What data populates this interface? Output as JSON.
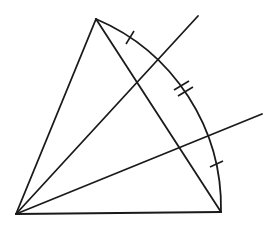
{
  "diagram": {
    "stroke_color": "#1a1a1a",
    "background": "#ffffff",
    "points": {
      "O": [
        16,
        214
      ],
      "A": [
        96,
        19
      ],
      "B": [
        221,
        212
      ]
    },
    "rays": [
      {
        "from": [
          16,
          214
        ],
        "to": [
          198,
          16
        ]
      },
      {
        "from": [
          16,
          214
        ],
        "to": [
          262,
          114
        ]
      }
    ],
    "arc": {
      "center": [
        16,
        214
      ],
      "radius": 205,
      "from": "A",
      "to": "B"
    },
    "tick_marks": [
      {
        "count": 1,
        "at": [
          130,
          38
        ]
      },
      {
        "count": 2,
        "at": [
          181,
          88
        ]
      },
      {
        "count": 1,
        "at": [
          217,
          162
        ]
      }
    ]
  }
}
